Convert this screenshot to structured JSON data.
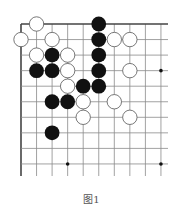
{
  "caption": "图1",
  "board": {
    "origin_x": 21,
    "origin_y": 24,
    "spacing": 15.55,
    "cols": 10,
    "rows": 10,
    "right_edge": 168,
    "bottom_edge": 176,
    "top_border": true,
    "left_border": true,
    "line_color": "#8a8a8a",
    "border_color": "#444444",
    "star_points": [
      [
        9,
        3
      ],
      [
        3,
        9
      ],
      [
        9,
        9
      ]
    ],
    "stones": [
      {
        "color": "white",
        "col": 1,
        "row": 0
      },
      {
        "color": "black",
        "col": 5,
        "row": 0
      },
      {
        "color": "white",
        "col": 0,
        "row": 1
      },
      {
        "color": "white",
        "col": 2,
        "row": 1
      },
      {
        "color": "black",
        "col": 5,
        "row": 1
      },
      {
        "color": "white",
        "col": 6,
        "row": 1
      },
      {
        "color": "white",
        "col": 7,
        "row": 1
      },
      {
        "color": "white",
        "col": 1,
        "row": 2
      },
      {
        "color": "black",
        "col": 2,
        "row": 2
      },
      {
        "color": "white",
        "col": 3,
        "row": 2
      },
      {
        "color": "black",
        "col": 5,
        "row": 2
      },
      {
        "color": "black",
        "col": 1,
        "row": 3
      },
      {
        "color": "black",
        "col": 2,
        "row": 3
      },
      {
        "color": "white",
        "col": 3,
        "row": 3
      },
      {
        "color": "black",
        "col": 5,
        "row": 3
      },
      {
        "color": "white",
        "col": 7,
        "row": 3
      },
      {
        "color": "white",
        "col": 3,
        "row": 4
      },
      {
        "color": "black",
        "col": 4,
        "row": 4
      },
      {
        "color": "black",
        "col": 5,
        "row": 4
      },
      {
        "color": "black",
        "col": 2,
        "row": 5
      },
      {
        "color": "black",
        "col": 3,
        "row": 5
      },
      {
        "color": "white",
        "col": 4,
        "row": 5
      },
      {
        "color": "white",
        "col": 6,
        "row": 5
      },
      {
        "color": "white",
        "col": 4,
        "row": 6
      },
      {
        "color": "white",
        "col": 7,
        "row": 6
      },
      {
        "color": "black",
        "col": 2,
        "row": 7
      }
    ]
  }
}
